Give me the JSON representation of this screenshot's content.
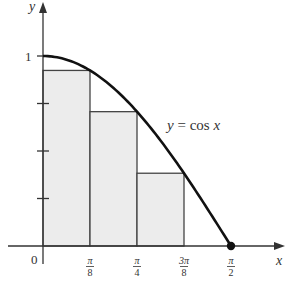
{
  "chart_data": {
    "type": "area",
    "title": "",
    "function_label": {
      "lhs": "y",
      "eq": " = ",
      "rhs_func": "cos ",
      "rhs_var": "x"
    },
    "xlabel": "x",
    "ylabel": "y",
    "xlim": [
      0,
      1.5708
    ],
    "ylim": [
      0,
      1
    ],
    "grid": false,
    "origin_label": "0",
    "x_ticks": [
      {
        "value": 0.3927,
        "num": "π",
        "den": "8"
      },
      {
        "value": 0.7854,
        "num": "π",
        "den": "4"
      },
      {
        "value": 1.1781,
        "num": "3π",
        "den": "8"
      },
      {
        "value": 1.5708,
        "num": "π",
        "den": "2"
      }
    ],
    "y_ticks": [
      {
        "value": 0.25,
        "label": ""
      },
      {
        "value": 0.5,
        "label": ""
      },
      {
        "value": 0.75,
        "label": ""
      },
      {
        "value": 1,
        "label": "1"
      }
    ],
    "curve": {
      "name": "y = cos x",
      "x": [
        0,
        0.3927,
        0.7854,
        1.1781,
        1.5708
      ],
      "y": [
        1,
        0.924,
        0.707,
        0.383,
        0
      ]
    },
    "rectangles": [
      {
        "x0": 0,
        "x1": 0.3927,
        "height": 0.924
      },
      {
        "x0": 0.3927,
        "x1": 0.7854,
        "height": 0.707
      },
      {
        "x0": 0.7854,
        "x1": 1.1781,
        "height": 0.383
      }
    ],
    "marked_point": {
      "x": 1.5708,
      "y": 0
    },
    "colors": {
      "rect_fill": "#ececec",
      "stroke": "#222222",
      "axis": "#333333"
    }
  }
}
